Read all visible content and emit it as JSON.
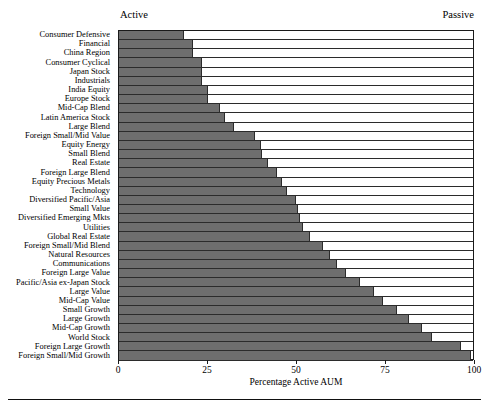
{
  "chart_data": {
    "type": "bar",
    "orientation": "horizontal",
    "title": "",
    "subtitle": "",
    "xlabel": "Percentage Active AUM",
    "ylabel": "",
    "xlim": [
      0,
      100
    ],
    "ylim": null,
    "grid": false,
    "legend_position": "top",
    "annotations": [
      {
        "text": "Active",
        "position": "top-left"
      },
      {
        "text": "Passive",
        "position": "top-right"
      }
    ],
    "xticks": [
      0,
      25,
      50,
      75,
      100
    ],
    "xticklabels": [
      "0",
      "25",
      "50",
      "75",
      "100"
    ],
    "series_name": "Percentage Active AUM",
    "bar_color": "#6e6e6e",
    "remainder_color": "#ffffff",
    "categories": [
      "Consumer Defensive",
      "Financial",
      "China Region",
      "Consumer Cyclical",
      "Japan Stock",
      "Industrials",
      "India Equity",
      "Europe Stock",
      "Mid-Cap Blend",
      "Latin America Stock",
      "Large Blend",
      "Foreign Small/Mid Value",
      "Equity Energy",
      "Small Blend",
      "Real Estate",
      "Foreign Large Blend",
      "Equity Precious Metals",
      "Technology",
      "Diversified Pacific/Asia",
      "Small Value",
      "Diversified Emerging Mkts",
      "Utilities",
      "Global Real Estate",
      "Foreign Small/Mid Blend",
      "Natural Resources",
      "Communications",
      "Foreign Large Value",
      "Pacific/Asia ex-Japan Stock",
      "Large Value",
      "Mid-Cap Value",
      "Small Growth",
      "Large Growth",
      "Mid-Cap Growth",
      "World Stock",
      "Foreign Large Growth",
      "Foreign Small/Mid Growth"
    ],
    "values": [
      18.5,
      20.8,
      20.8,
      23.5,
      23.5,
      23.5,
      25.0,
      25.0,
      28.5,
      30.0,
      32.5,
      38.5,
      40.0,
      40.5,
      42.0,
      44.5,
      46.0,
      47.5,
      50.0,
      50.5,
      51.0,
      52.0,
      54.0,
      57.5,
      59.5,
      61.5,
      64.0,
      68.0,
      72.0,
      74.5,
      78.5,
      82.0,
      85.5,
      88.5,
      96.5,
      99.5
    ]
  }
}
